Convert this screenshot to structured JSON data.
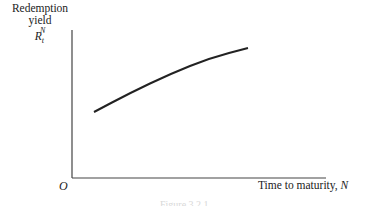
{
  "chart_data": {
    "type": "line",
    "title": "",
    "xlabel": "Time to maturity, N",
    "ylabel": "Redemption yield R_t^N",
    "origin_label": "O",
    "grid": false,
    "legend": null,
    "ticks": {
      "x": [],
      "y": []
    },
    "series": [
      {
        "name": "yield curve",
        "shape": "concave upward-sloping",
        "points_px": [
          [
            94,
            112
          ],
          [
            130,
            93
          ],
          [
            170,
            74
          ],
          [
            210,
            58
          ],
          [
            248,
            48
          ]
        ]
      }
    ]
  },
  "labels": {
    "ylabel_line1": "Redemption",
    "ylabel_line2": "yield",
    "ylabel_symbol": "R",
    "ylabel_sub": "t",
    "ylabel_sup": "N",
    "origin": "O",
    "xlabel_text": "Time to maturity, ",
    "xlabel_var": "N",
    "caption": "Figure 3.2.1"
  }
}
